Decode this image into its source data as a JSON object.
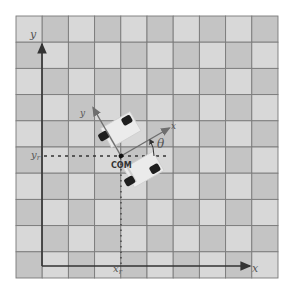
{
  "diagram": {
    "type": "robot-pose-coordinate-frame",
    "grid": {
      "columns": 10,
      "rows": 10,
      "cell_size_px": 26.2,
      "light_color": "#d8d8d8",
      "dark_color": "#c4c4c4",
      "line_color": "#7a7a7a"
    },
    "axes": {
      "x_label": "x",
      "y_label": "y"
    },
    "robot": {
      "com_label": "COM",
      "robot_x_axis_label": "x",
      "robot_y_axis_label": "y",
      "theta_label": "θ",
      "position_x_label": "x",
      "position_x_subscript": "r",
      "position_y_label": "y",
      "position_y_subscript": "r",
      "heading_deg": 30
    },
    "colors": {
      "axis": "#444444",
      "robot_axis": "#6e6e6e",
      "wheel": "#1e1e1e",
      "chassis": "#ebebeb",
      "dashed": "#333333"
    }
  }
}
